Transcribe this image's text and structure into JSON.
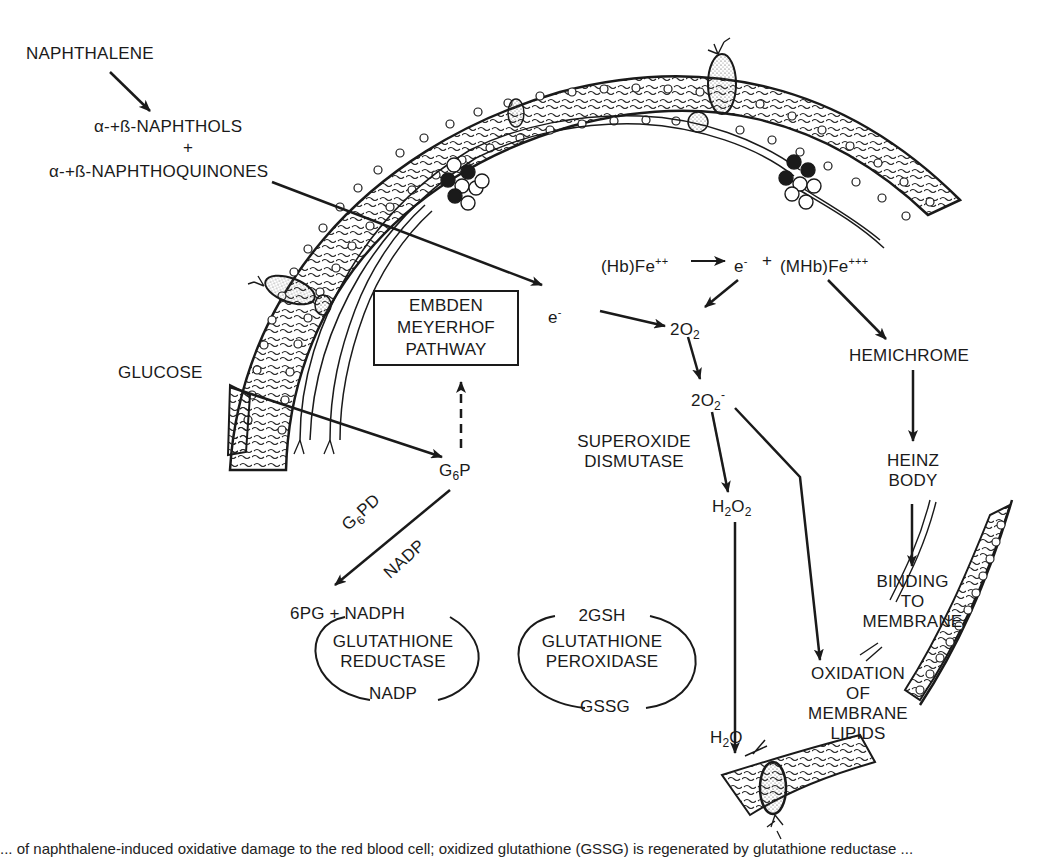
{
  "figure": {
    "type": "biochemical-pathway-diagram"
  },
  "nodes": {
    "naphthalene": "NAPHTHALENE",
    "naphthols": "α-+ß-NAPHTHOLS",
    "plus": "+",
    "naphthoquinones": "α-+ß-NAPHTHOQUINONES",
    "hb_fe2": "(Hb)Fe",
    "hb_fe2_sup": "++",
    "electron_hb": "e",
    "electron_hb_sup": "-",
    "plus_mhb": "+",
    "mhb_fe3": "(MHb)Fe",
    "mhb_fe3_sup": "+++",
    "electron": "e",
    "electron_sup": "-",
    "o2": "2O",
    "o2_sub": "2",
    "superoxide": "2O",
    "superoxide_sub": "2",
    "superoxide_sup": "-",
    "h2o2_h": "H",
    "h2o2_sub1": "2",
    "h2o2_o": "O",
    "h2o2_sub2": "2",
    "h2o_h": "H",
    "h2o_sub": "2",
    "h2o_o": "O",
    "glucose": "GLUCOSE",
    "g6p_g": "G",
    "g6p_sub": "6",
    "g6p_p": "P",
    "embden_line1": "EMBDEN",
    "embden_line2": "MEYERHOF",
    "embden_line3": "PATHWAY",
    "g6pd_g": "G",
    "g6pd_sub": "6",
    "g6pd_pd": "PD",
    "nadp_cofactor": "NADP",
    "sixpg": "6PG + NADPH",
    "gr_line1": "GLUTATHIONE",
    "gr_line2": "REDUCTASE",
    "gr_bottom": "NADP",
    "gp_top": "2GSH",
    "gp_line1": "GLUTATHIONE",
    "gp_line2": "PEROXIDASE",
    "gp_bottom": "GSSG",
    "sod_line1": "SUPEROXIDE",
    "sod_line2": "DISMUTASE",
    "hemichrome": "HEMICHROME",
    "heinz_line1": "HEINZ",
    "heinz_line2": "BODY",
    "binding_line1": "BINDING",
    "binding_line2": "TO",
    "binding_line3": "MEMBRANE",
    "oxid_line1": "OXIDATION",
    "oxid_line2": "OF",
    "oxid_line3": "MEMBRANE",
    "oxid_line4": "LIPIDS"
  },
  "edges": [
    {
      "from": "NAPHTHALENE",
      "to": "NAPHTHOLS + NAPHTHOQUINONES",
      "style": "solid"
    },
    {
      "from": "NAPHTHOQUINONES",
      "to": "e-",
      "style": "solid"
    },
    {
      "from": "(Hb)Fe++",
      "to": "e- + (MHb)Fe+++",
      "style": "solid"
    },
    {
      "from": "e- (Hb)",
      "to": "2O2",
      "style": "solid"
    },
    {
      "from": "e-",
      "to": "2O2",
      "style": "solid"
    },
    {
      "from": "(MHb)Fe+++",
      "to": "HEMICHROME",
      "style": "solid"
    },
    {
      "from": "2O2",
      "to": "2O2-",
      "style": "solid"
    },
    {
      "from": "2O2-",
      "to": "H2O2",
      "style": "solid",
      "label": "SUPEROXIDE DISMUTASE"
    },
    {
      "from": "2O2-",
      "to": "OXIDATION OF MEMBRANE LIPIDS",
      "style": "solid"
    },
    {
      "from": "H2O2",
      "to": "H2O",
      "style": "solid"
    },
    {
      "from": "HEMICHROME",
      "to": "HEINZ BODY",
      "style": "solid"
    },
    {
      "from": "HEINZ BODY",
      "to": "BINDING TO MEMBRANE",
      "style": "solid"
    },
    {
      "from": "GLUCOSE",
      "to": "G6P",
      "style": "solid"
    },
    {
      "from": "G6P",
      "to": "EMBDEN MEYERHOF PATHWAY",
      "style": "dashed"
    },
    {
      "from": "G6P",
      "to": "6PG + NADPH",
      "style": "solid",
      "label": "G6PD / NADP"
    }
  ],
  "colors": {
    "ink": "#1a1a1a",
    "paper": "#ffffff",
    "stipple": "#555555"
  },
  "caption": "... of naphthalene-induced oxidative damage to the red blood cell; oxidized glutathione (GSSG) is regenerated by glutathione reductase ..."
}
